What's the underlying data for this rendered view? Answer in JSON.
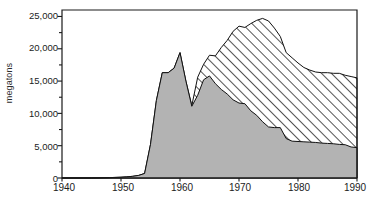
{
  "chart_data": {
    "type": "area",
    "title": "",
    "subtitle": "",
    "xlabel": "",
    "ylabel": "megatons",
    "stacked": true,
    "grid": false,
    "legend_position": "none",
    "xlim": [
      1940,
      1990
    ],
    "ylim": [
      0,
      26000
    ],
    "xticks": [
      1940,
      1950,
      1960,
      1970,
      1980,
      1990
    ],
    "xtick_labels": [
      "1940",
      "1950",
      "1960",
      "1970",
      "1980",
      "1990"
    ],
    "yticks": [
      0,
      5000,
      10000,
      15000,
      20000,
      25000
    ],
    "ytick_labels": [
      "0",
      "5,000",
      "10,000",
      "15,000",
      "20,000",
      "25,000"
    ],
    "yminor_ticks": [
      2500,
      7500,
      12500,
      17500,
      22500
    ],
    "x": [
      1940,
      1945,
      1948,
      1950,
      1951,
      1952,
      1953,
      1954,
      1955,
      1956,
      1957,
      1958,
      1959,
      1960,
      1961,
      1962,
      1963,
      1964,
      1965,
      1966,
      1967,
      1968,
      1969,
      1970,
      1971,
      1972,
      1973,
      1974,
      1975,
      1976,
      1977,
      1978,
      1979,
      1980,
      1981,
      1982,
      1983,
      1984,
      1985,
      1986,
      1987,
      1988,
      1989,
      1990
    ],
    "series": [
      {
        "name": "lower-area",
        "fill": "grey",
        "values": [
          0,
          0,
          60,
          120,
          180,
          260,
          400,
          700,
          5200,
          12000,
          16300,
          16300,
          17000,
          19400,
          15000,
          11100,
          12800,
          15200,
          15800,
          14600,
          13700,
          13000,
          12100,
          11600,
          11500,
          10400,
          9700,
          8700,
          7900,
          7800,
          7800,
          6100,
          5700,
          5650,
          5600,
          5550,
          5500,
          5400,
          5350,
          5300,
          5200,
          5150,
          4800,
          4700
        ]
      },
      {
        "name": "upper-area",
        "fill": "hatched",
        "values": [
          0,
          0,
          60,
          120,
          180,
          260,
          400,
          700,
          5200,
          12000,
          16300,
          16300,
          17000,
          19400,
          15000,
          11200,
          15600,
          17600,
          19000,
          18900,
          20200,
          21300,
          22700,
          23500,
          23300,
          23900,
          24400,
          24700,
          24300,
          23200,
          21900,
          19400,
          18600,
          17800,
          17100,
          16700,
          16400,
          16300,
          16300,
          16200,
          16200,
          15900,
          15700,
          15500
        ]
      }
    ],
    "annotations": [],
    "colors": {
      "lower_fill": "#b3b3b3",
      "upper_fill": "#ffffff",
      "hatch_line": "#1a1a1a",
      "axis": "#1a1a1a",
      "text": "#1c1c1c"
    }
  }
}
